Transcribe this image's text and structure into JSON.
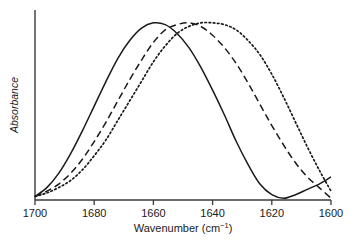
{
  "chart_data": {
    "type": "line",
    "title": "",
    "xlabel": "Wavenumber (cm⁻¹)",
    "ylabel": "Absorbance",
    "xlabel_main": "Wavenumber (cm",
    "xlabel_sup": "−1",
    "xlabel_tail": ")",
    "xlim": [
      1700,
      1600
    ],
    "ylim": [
      0,
      1.05
    ],
    "x_ticks": [
      1700,
      1680,
      1660,
      1640,
      1620,
      1600
    ],
    "x_tick_labels": [
      "1700",
      "1680",
      "1660",
      "1640",
      "1620",
      "1600"
    ],
    "y_ticks": [],
    "y_tick_labels": [],
    "grid": false,
    "legend": false,
    "legend_position": "none",
    "axis_color": "#3a3a3a",
    "line_color": "#1a1a1a",
    "background": "#ffffff",
    "series": [
      {
        "name": "solid",
        "style": "solid",
        "color": "#1a1a1a",
        "peak_x": 1658,
        "peak_y": 1.0,
        "x": [
          1700,
          1696,
          1692,
          1688,
          1684,
          1680,
          1676,
          1672,
          1668,
          1664,
          1660,
          1656,
          1652,
          1648,
          1644,
          1640,
          1636,
          1632,
          1628,
          1624,
          1620,
          1616,
          1612,
          1608,
          1604,
          1600
        ],
        "values": [
          0.02,
          0.07,
          0.15,
          0.26,
          0.39,
          0.53,
          0.67,
          0.8,
          0.9,
          0.97,
          1.0,
          0.99,
          0.94,
          0.86,
          0.75,
          0.62,
          0.48,
          0.33,
          0.2,
          0.09,
          0.03,
          0.01,
          0.03,
          0.06,
          0.09,
          0.13
        ]
      },
      {
        "name": "dashed",
        "style": "dashed",
        "color": "#1a1a1a",
        "peak_x": 1648,
        "peak_y": 1.0,
        "x": [
          1700,
          1696,
          1692,
          1688,
          1684,
          1680,
          1676,
          1672,
          1668,
          1664,
          1660,
          1656,
          1652,
          1648,
          1644,
          1640,
          1636,
          1632,
          1628,
          1624,
          1620,
          1616,
          1612,
          1608,
          1604,
          1600
        ],
        "values": [
          0.02,
          0.05,
          0.09,
          0.15,
          0.23,
          0.33,
          0.44,
          0.56,
          0.68,
          0.79,
          0.89,
          0.96,
          0.99,
          1.0,
          0.98,
          0.93,
          0.86,
          0.77,
          0.66,
          0.54,
          0.42,
          0.31,
          0.21,
          0.13,
          0.07,
          0.01
        ]
      },
      {
        "name": "dotted",
        "style": "dotted",
        "color": "#1a1a1a",
        "peak_x": 1636,
        "peak_y": 1.0,
        "x": [
          1700,
          1696,
          1692,
          1688,
          1684,
          1680,
          1676,
          1672,
          1668,
          1664,
          1660,
          1656,
          1652,
          1648,
          1644,
          1640,
          1636,
          1632,
          1628,
          1624,
          1620,
          1616,
          1612,
          1608,
          1604,
          1600
        ],
        "values": [
          0.02,
          0.04,
          0.07,
          0.11,
          0.17,
          0.25,
          0.34,
          0.45,
          0.56,
          0.67,
          0.78,
          0.87,
          0.94,
          0.98,
          1.0,
          1.0,
          0.99,
          0.96,
          0.9,
          0.82,
          0.71,
          0.58,
          0.44,
          0.3,
          0.17,
          0.05
        ]
      }
    ]
  }
}
